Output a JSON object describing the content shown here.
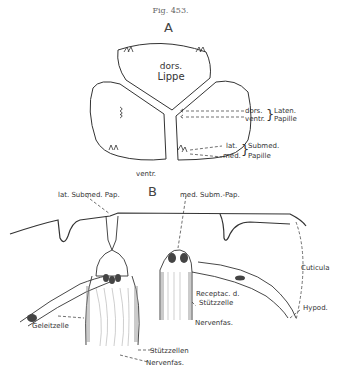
{
  "figure": {
    "title": "Fig. 453.",
    "panels": {
      "A": {
        "label": "A",
        "dorsal_lip_line1": "dors.",
        "dorsal_lip_line2": "Lippe",
        "bottom_label": "ventr.",
        "annotations": {
          "dors": "dors.",
          "ventr": "ventr.",
          "laten": "Laten.",
          "papille1": "Papille",
          "lat": "lat.",
          "med": "med.",
          "submed": "Submed.",
          "papille2": "Papille"
        }
      },
      "B": {
        "label": "B",
        "annotations": {
          "lat_submed_pap": "lat. Submed. Pap.",
          "med_subm_pap": "med. Subm.-Pap.",
          "cuticula": "Cuticula",
          "receptac_line1": "Receptac. d.",
          "receptac_line2": "Stützzelle",
          "hypod": "Hypod.",
          "nervenfas1": "Nervenfas.",
          "geleitzelle": "Geleitzelle",
          "stuetzzellen": "Stützzellen",
          "nervenfas2": "Nervenfas."
        }
      }
    }
  }
}
